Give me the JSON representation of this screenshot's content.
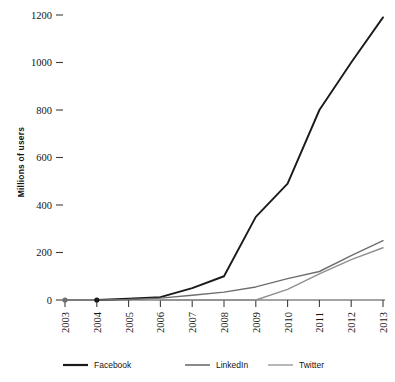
{
  "chart_data": {
    "type": "line",
    "title": "",
    "xlabel": "",
    "ylabel": "Millions of users",
    "x": [
      2003,
      2004,
      2005,
      2006,
      2007,
      2008,
      2009,
      2010,
      2011,
      2012,
      2013
    ],
    "xtick_labels": [
      "2003",
      "2004",
      "2005",
      "2006",
      "2007",
      "2008",
      "2009",
      "2010",
      "2011",
      "2012",
      "2013"
    ],
    "ytick_labels": [
      "0",
      "200",
      "400",
      "600",
      "800",
      "1000",
      "1200"
    ],
    "yticks": [
      0,
      200,
      400,
      600,
      800,
      1000,
      1200
    ],
    "ylim": [
      0,
      1250
    ],
    "xlim": [
      2003,
      2013
    ],
    "grid": false,
    "legend_position": "bottom",
    "series": [
      {
        "name": "Facebook",
        "color": "#1a1a1a",
        "width": 1.9,
        "x": [
          2004,
          2005,
          2006,
          2007,
          2008,
          2009,
          2010,
          2011,
          2012,
          2013
        ],
        "values": [
          0,
          5,
          12,
          50,
          100,
          350,
          490,
          800,
          1000,
          1190
        ],
        "start_marker_year": 2004,
        "start_marker_value": 0
      },
      {
        "name": "LinkedIn",
        "color": "#6e6e6e",
        "width": 1.4,
        "x": [
          2003,
          2004,
          2005,
          2006,
          2007,
          2008,
          2009,
          2010,
          2011,
          2012,
          2013
        ],
        "values": [
          0,
          0,
          2,
          8,
          20,
          33,
          55,
          90,
          120,
          187,
          250
        ],
        "start_marker_year": 2003,
        "start_marker_value": 0
      },
      {
        "name": "Twitter",
        "color": "#8f8f8f",
        "width": 1.4,
        "x": [
          2006,
          2007,
          2008,
          2009,
          2010,
          2011,
          2012,
          2013
        ],
        "values": [
          0,
          0,
          0,
          0,
          45,
          110,
          170,
          220
        ]
      }
    ]
  },
  "legend": {
    "items": [
      {
        "label": "Facebook",
        "color": "#1a1a1a",
        "width": 2.2
      },
      {
        "label": "LinkedIn",
        "color": "#6e6e6e",
        "width": 1.6
      },
      {
        "label": "Twitter",
        "color": "#9a9a9a",
        "width": 1.4
      }
    ]
  }
}
